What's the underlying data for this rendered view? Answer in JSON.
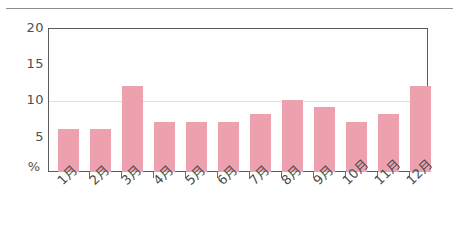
{
  "chart_data": {
    "type": "bar",
    "title": "",
    "subtitle": "",
    "xlabel": "",
    "ylabel": "%",
    "unit_label": "%",
    "categories": [
      "1月",
      "2月",
      "3月",
      "4月",
      "5月",
      "6月",
      "7月",
      "8月",
      "9月",
      "10月",
      "11月",
      "12月"
    ],
    "values": [
      6,
      6,
      12,
      7,
      7,
      7,
      8,
      10,
      9,
      7,
      8,
      12
    ],
    "series": [
      {
        "name": "",
        "values": [
          6,
          6,
          12,
          7,
          7,
          7,
          8,
          10,
          9,
          7,
          8,
          12
        ]
      }
    ],
    "ylim": [
      0,
      20
    ],
    "yticks": [
      0,
      5,
      10,
      15,
      20
    ],
    "ytick_labels": [
      "%",
      "5",
      "10",
      "15",
      "20"
    ],
    "grid": "horizontal-at-10-only",
    "gridlines_at": [
      10
    ],
    "legend": "none",
    "bar_color": "#eda0ad",
    "axis_color": "#5c5c5c",
    "gridline_color": "#f0d9dd",
    "text_color": "#4a4a4a",
    "xtick_label_rotation": -45
  },
  "axis": {
    "y": {
      "t0": "%",
      "t5": "5",
      "t10": "10",
      "t15": "15",
      "t20": "20"
    }
  },
  "categories": {
    "c0": "1月",
    "c1": "2月",
    "c2": "3月",
    "c3": "4月",
    "c4": "5月",
    "c5": "6月",
    "c6": "7月",
    "c7": "8月",
    "c8": "9月",
    "c9": "10月",
    "c10": "11月",
    "c11": "12月"
  }
}
